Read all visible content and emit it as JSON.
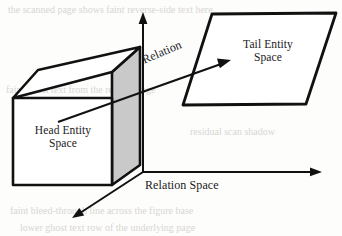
{
  "figure": {
    "background_color": "#fdfdfc",
    "stroke_color": "#111111",
    "shaded_face_color": "#c9c9c9",
    "text_color": "#1a1a1a"
  },
  "labels": {
    "head_entity_space": "Head Entity\nSpace",
    "tail_entity_space": "Tail Entity\nSpace",
    "relation": "Relation",
    "relation_space": "Relation Space"
  },
  "axes": {
    "vertical_axis_name": "vertical-axis",
    "horizontal_axis_name": "horizontal-axis",
    "depth_axis_name": "depth-axis"
  },
  "shapes": {
    "cube_name": "head-entity-cube",
    "parallelogram_name": "tail-entity-plane",
    "relation_arrow_name": "relation-arrow"
  },
  "scan_artifacts": [
    {
      "text": "a line of faint bleed-through text",
      "left": 8,
      "top": 4
    },
    {
      "text": "faint ghost text from reverse page",
      "left": 6,
      "top": 84
    },
    {
      "text": "residual scan shadow text",
      "left": 190,
      "top": 126
    },
    {
      "text": "faint bleed-through line",
      "left": 10,
      "top": 205
    },
    {
      "text": "lower ghost text row",
      "left": 20,
      "top": 222
    }
  ]
}
